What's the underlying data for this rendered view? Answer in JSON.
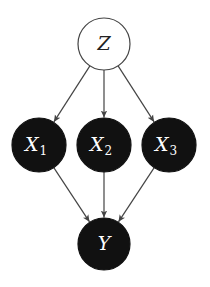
{
  "diagram": {
    "type": "directed-graphical-model",
    "colors": {
      "background": "#ffffff",
      "observed_fill": "#111111",
      "latent_fill": "#ffffff",
      "stroke": "#444444",
      "edge": "#444444",
      "light_text": "#ffffff",
      "dark_text": "#222222"
    },
    "nodes": [
      {
        "id": "Z",
        "label": "Z",
        "subscript": "",
        "cx": 104,
        "cy": 44,
        "r": 26,
        "style": "latent"
      },
      {
        "id": "X1",
        "label": "X",
        "subscript": "1",
        "cx": 39,
        "cy": 145,
        "r": 27,
        "style": "observed"
      },
      {
        "id": "X2",
        "label": "X",
        "subscript": "2",
        "cx": 104,
        "cy": 145,
        "r": 27,
        "style": "observed"
      },
      {
        "id": "X3",
        "label": "X",
        "subscript": "3",
        "cx": 169,
        "cy": 145,
        "r": 27,
        "style": "observed"
      },
      {
        "id": "Y",
        "label": "Y",
        "subscript": "",
        "cx": 104,
        "cy": 244,
        "r": 26,
        "style": "observed"
      }
    ],
    "edges": [
      {
        "from": "Z",
        "to": "X1"
      },
      {
        "from": "Z",
        "to": "X2"
      },
      {
        "from": "Z",
        "to": "X3"
      },
      {
        "from": "X1",
        "to": "Y"
      },
      {
        "from": "X2",
        "to": "Y"
      },
      {
        "from": "X3",
        "to": "Y"
      }
    ]
  }
}
